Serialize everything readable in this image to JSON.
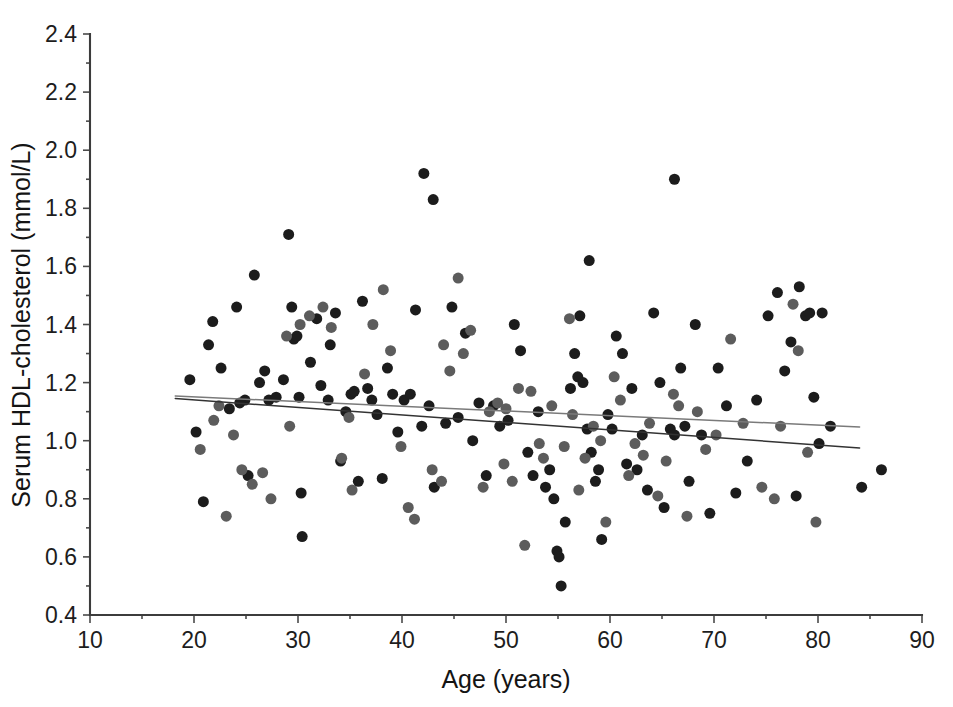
{
  "chart_data": {
    "type": "scatter",
    "title": "",
    "xlabel": "Age (years)",
    "ylabel": "Serum HDL-cholesterol (mmol/L)",
    "xlim": [
      10,
      90
    ],
    "ylim": [
      0.4,
      2.4
    ],
    "xticks": [
      10,
      20,
      30,
      40,
      50,
      60,
      70,
      80,
      90
    ],
    "yticks": [
      0.4,
      0.6,
      0.8,
      1.0,
      1.2,
      1.4,
      1.6,
      1.8,
      2.0,
      2.2,
      2.4
    ],
    "xtick_labels": [
      "10",
      "20",
      "30",
      "40",
      "50",
      "60",
      "70",
      "80",
      "90"
    ],
    "ytick_labels": [
      "0.4",
      "0.6",
      "0.8",
      "1.0",
      "1.2",
      "1.4",
      "1.6",
      "1.8",
      "2.0",
      "2.2",
      "2.4"
    ],
    "grid": false,
    "legend": "none",
    "marker_shape": "circle",
    "marker_size_px": 11,
    "series": [
      {
        "name": "group-dark",
        "color": "#1c1c1c",
        "points": [
          [
            19.6,
            1.21
          ],
          [
            20.2,
            1.03
          ],
          [
            20.9,
            0.79
          ],
          [
            21.4,
            1.33
          ],
          [
            21.8,
            1.41
          ],
          [
            22.6,
            1.25
          ],
          [
            23.4,
            1.11
          ],
          [
            24.1,
            1.46
          ],
          [
            24.4,
            1.13
          ],
          [
            24.9,
            1.14
          ],
          [
            25.2,
            0.88
          ],
          [
            25.8,
            1.57
          ],
          [
            26.3,
            1.2
          ],
          [
            26.8,
            1.24
          ],
          [
            27.2,
            1.14
          ],
          [
            27.9,
            1.15
          ],
          [
            28.6,
            1.21
          ],
          [
            29.1,
            1.71
          ],
          [
            29.4,
            1.46
          ],
          [
            29.6,
            1.35
          ],
          [
            29.9,
            1.36
          ],
          [
            30.1,
            1.15
          ],
          [
            30.3,
            0.82
          ],
          [
            30.4,
            0.67
          ],
          [
            31.2,
            1.27
          ],
          [
            31.8,
            1.42
          ],
          [
            32.2,
            1.19
          ],
          [
            32.9,
            1.14
          ],
          [
            33.1,
            1.33
          ],
          [
            33.6,
            1.44
          ],
          [
            34.1,
            0.93
          ],
          [
            34.6,
            1.1
          ],
          [
            35.1,
            1.16
          ],
          [
            35.4,
            1.17
          ],
          [
            35.8,
            0.86
          ],
          [
            36.2,
            1.48
          ],
          [
            36.7,
            1.18
          ],
          [
            37.1,
            1.14
          ],
          [
            37.6,
            1.09
          ],
          [
            38.1,
            0.87
          ],
          [
            38.6,
            1.25
          ],
          [
            39.1,
            1.16
          ],
          [
            39.6,
            1.03
          ],
          [
            40.2,
            1.14
          ],
          [
            40.8,
            1.16
          ],
          [
            41.3,
            1.45
          ],
          [
            41.9,
            1.05
          ],
          [
            42.6,
            1.12
          ],
          [
            43.1,
            0.84
          ],
          [
            44.2,
            1.06
          ],
          [
            44.8,
            1.46
          ],
          [
            45.4,
            1.08
          ],
          [
            46.1,
            1.37
          ],
          [
            46.8,
            1.0
          ],
          [
            47.4,
            1.13
          ],
          [
            48.1,
            0.88
          ],
          [
            48.8,
            1.12
          ],
          [
            49.4,
            1.05
          ],
          [
            50.2,
            1.07
          ],
          [
            50.8,
            1.4
          ],
          [
            51.4,
            1.31
          ],
          [
            52.1,
            0.96
          ],
          [
            52.6,
            0.88
          ],
          [
            53.1,
            1.1
          ],
          [
            53.8,
            0.84
          ],
          [
            54.2,
            0.9
          ],
          [
            54.6,
            0.8
          ],
          [
            54.9,
            0.62
          ],
          [
            55.1,
            0.6
          ],
          [
            55.3,
            0.5
          ],
          [
            55.7,
            0.72
          ],
          [
            56.2,
            1.18
          ],
          [
            56.6,
            1.3
          ],
          [
            56.9,
            1.22
          ],
          [
            57.1,
            1.43
          ],
          [
            57.4,
            1.2
          ],
          [
            57.8,
            1.04
          ],
          [
            58.2,
            0.96
          ],
          [
            58.6,
            0.86
          ],
          [
            58.9,
            0.9
          ],
          [
            59.2,
            0.66
          ],
          [
            59.8,
            1.09
          ],
          [
            60.2,
            1.04
          ],
          [
            60.6,
            1.36
          ],
          [
            61.2,
            1.3
          ],
          [
            61.6,
            0.92
          ],
          [
            62.1,
            1.18
          ],
          [
            62.6,
            0.9
          ],
          [
            63.1,
            1.02
          ],
          [
            63.6,
            0.83
          ],
          [
            64.2,
            1.44
          ],
          [
            64.8,
            1.2
          ],
          [
            65.2,
            0.77
          ],
          [
            65.8,
            1.04
          ],
          [
            66.2,
            1.02
          ],
          [
            66.8,
            1.25
          ],
          [
            67.2,
            1.05
          ],
          [
            67.6,
            0.86
          ],
          [
            68.2,
            1.4
          ],
          [
            68.8,
            1.02
          ],
          [
            69.6,
            0.75
          ],
          [
            70.4,
            1.25
          ],
          [
            71.2,
            1.12
          ],
          [
            72.1,
            0.82
          ],
          [
            73.2,
            0.93
          ],
          [
            74.1,
            1.14
          ],
          [
            75.2,
            1.43
          ],
          [
            76.1,
            1.51
          ],
          [
            76.8,
            1.24
          ],
          [
            77.4,
            1.34
          ],
          [
            77.9,
            0.81
          ],
          [
            78.2,
            1.53
          ],
          [
            78.8,
            1.43
          ],
          [
            79.2,
            1.44
          ],
          [
            79.6,
            1.15
          ],
          [
            80.1,
            0.99
          ],
          [
            80.4,
            1.44
          ],
          [
            81.2,
            1.05
          ],
          [
            84.2,
            0.84
          ],
          [
            86.1,
            0.9
          ],
          [
            42.1,
            1.92
          ],
          [
            43.0,
            1.83
          ],
          [
            66.2,
            1.9
          ],
          [
            58.0,
            1.62
          ]
        ]
      },
      {
        "name": "group-gray",
        "color": "#5c5c5c",
        "points": [
          [
            20.6,
            0.97
          ],
          [
            21.9,
            1.07
          ],
          [
            23.1,
            0.74
          ],
          [
            23.8,
            1.02
          ],
          [
            24.6,
            0.9
          ],
          [
            25.6,
            0.85
          ],
          [
            27.4,
            0.8
          ],
          [
            28.9,
            1.36
          ],
          [
            30.2,
            1.4
          ],
          [
            31.1,
            1.43
          ],
          [
            32.4,
            1.46
          ],
          [
            33.2,
            1.39
          ],
          [
            34.2,
            0.94
          ],
          [
            35.2,
            0.83
          ],
          [
            36.4,
            1.23
          ],
          [
            37.2,
            1.4
          ],
          [
            38.2,
            1.52
          ],
          [
            38.9,
            1.31
          ],
          [
            39.9,
            0.98
          ],
          [
            40.6,
            0.77
          ],
          [
            41.2,
            0.73
          ],
          [
            42.9,
            0.9
          ],
          [
            43.8,
            0.86
          ],
          [
            44.6,
            1.24
          ],
          [
            45.4,
            1.56
          ],
          [
            45.9,
            1.3
          ],
          [
            46.6,
            1.38
          ],
          [
            47.8,
            0.84
          ],
          [
            48.4,
            1.1
          ],
          [
            49.2,
            1.13
          ],
          [
            49.8,
            0.92
          ],
          [
            50.6,
            0.86
          ],
          [
            51.2,
            1.18
          ],
          [
            51.8,
            0.64
          ],
          [
            52.4,
            1.17
          ],
          [
            53.2,
            0.99
          ],
          [
            53.6,
            0.94
          ],
          [
            54.4,
            1.12
          ],
          [
            55.6,
            0.98
          ],
          [
            56.1,
            1.42
          ],
          [
            56.4,
            1.09
          ],
          [
            57.0,
            0.83
          ],
          [
            57.6,
            0.94
          ],
          [
            58.4,
            1.05
          ],
          [
            59.1,
            1.0
          ],
          [
            59.6,
            0.72
          ],
          [
            60.4,
            1.22
          ],
          [
            61.0,
            1.14
          ],
          [
            61.8,
            0.88
          ],
          [
            62.4,
            0.99
          ],
          [
            63.2,
            0.95
          ],
          [
            63.8,
            1.06
          ],
          [
            64.6,
            0.81
          ],
          [
            65.4,
            0.93
          ],
          [
            66.1,
            1.16
          ],
          [
            66.6,
            1.12
          ],
          [
            67.4,
            0.74
          ],
          [
            68.4,
            1.1
          ],
          [
            69.2,
            0.97
          ],
          [
            70.2,
            1.02
          ],
          [
            71.6,
            1.35
          ],
          [
            72.8,
            1.06
          ],
          [
            74.6,
            0.84
          ],
          [
            75.8,
            0.8
          ],
          [
            76.4,
            1.05
          ],
          [
            77.6,
            1.47
          ],
          [
            78.1,
            1.31
          ],
          [
            79.0,
            0.96
          ],
          [
            79.8,
            0.72
          ],
          [
            44.0,
            1.33
          ],
          [
            50.0,
            1.11
          ],
          [
            34.9,
            1.08
          ],
          [
            29.2,
            1.05
          ],
          [
            26.6,
            0.89
          ],
          [
            22.4,
            1.12
          ]
        ]
      }
    ],
    "fit_lines": [
      {
        "name": "upper-trend-line",
        "color": "#7a7a7a",
        "x_start": 18.2,
        "x_end": 84.0,
        "y_start": 1.154,
        "y_end": 1.047
      },
      {
        "name": "lower-trend-line",
        "color": "#333333",
        "x_start": 18.2,
        "x_end": 84.0,
        "y_start": 1.145,
        "y_end": 0.975
      }
    ]
  }
}
